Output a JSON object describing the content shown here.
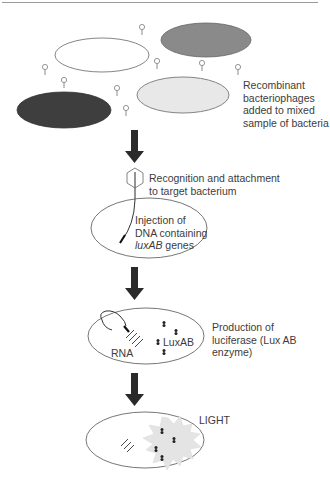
{
  "diagram": {
    "colors": {
      "outline": "#555555",
      "bacterium_white": "#ffffff",
      "bacterium_gray": "#8a8a8a",
      "bacterium_dark": "#3e3e3e",
      "bacterium_light": "#e8e8e8",
      "arrow": "#2a2a2a",
      "light_burst": "#e4e4e4"
    },
    "steps": [
      {
        "id": "step-1",
        "label_lines": [
          "Recombinant",
          "bacteriophages",
          "added to mixed",
          "sample of bacteria"
        ]
      },
      {
        "id": "step-2",
        "label_lines": [
          "Recognition and attachment",
          "to target bacterium"
        ]
      },
      {
        "id": "step-3",
        "label_line1": "Injection of",
        "label_line2": "DNA containing",
        "label_line3_italic": "luxAB",
        "label_line3_rest": " genes"
      },
      {
        "id": "step-4",
        "label_lines": [
          "Production of",
          "luciferase (Lux AB",
          "enzyme)"
        ],
        "inner_labels": {
          "rna": "RNA",
          "enzyme": "LuxAB"
        }
      },
      {
        "id": "step-5",
        "label": "LIGHT"
      }
    ]
  }
}
